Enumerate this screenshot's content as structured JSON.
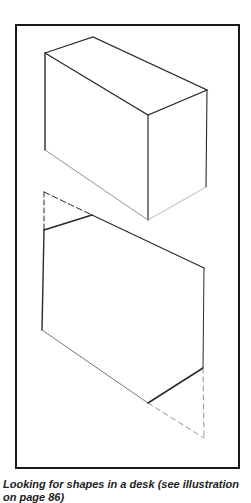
{
  "figure": {
    "caption": "Looking for shapes in a desk (see illustration on page 86)",
    "line_color": "#2a2a2a",
    "frame_color": "#1a1a1a"
  }
}
